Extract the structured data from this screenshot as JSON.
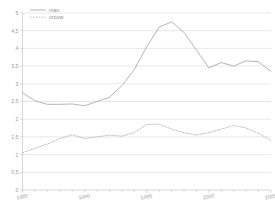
{
  "chart_data": {
    "type": "line",
    "title": "",
    "subtitle": "",
    "xlabel": "",
    "ylabel": "",
    "xlim": [
      1985,
      2005
    ],
    "ylim": [
      0,
      5
    ],
    "grid": true,
    "grid_axis": "y",
    "legend_position": "top-left",
    "x": [
      1985,
      1986,
      1987,
      1988,
      1989,
      1990,
      1991,
      1992,
      1993,
      1994,
      1995,
      1996,
      1997,
      1998,
      1999,
      2000,
      2001,
      2002,
      2003,
      2004,
      2005
    ],
    "x_tick_labels": [
      "1985",
      "1990",
      "1995",
      "2000",
      "2005"
    ],
    "x_tick_values": [
      1985,
      1990,
      1995,
      2000,
      2005
    ],
    "y_tick_labels": [
      "0",
      "0,5",
      "1",
      "1,5",
      "2",
      "2,5",
      "3",
      "3,5",
      "4",
      "4,5",
      "5"
    ],
    "y_tick_values": [
      0,
      0.5,
      1,
      1.5,
      2,
      2.5,
      3,
      3.5,
      4,
      4.5,
      5
    ],
    "series": [
      {
        "name": "man",
        "style": "solid",
        "color": "#a8a8a8",
        "values": [
          2.75,
          2.52,
          2.42,
          2.42,
          2.43,
          2.38,
          2.5,
          2.62,
          2.95,
          3.4,
          4.05,
          4.6,
          4.75,
          4.45,
          3.95,
          3.45,
          3.6,
          3.5,
          3.65,
          3.62,
          3.35
        ]
      },
      {
        "name": "vrouw",
        "style": "dotted",
        "color": "#b5b5b5",
        "values": [
          1.05,
          1.18,
          1.3,
          1.45,
          1.56,
          1.46,
          1.5,
          1.55,
          1.52,
          1.62,
          1.85,
          1.86,
          1.72,
          1.62,
          1.55,
          1.62,
          1.72,
          1.82,
          1.75,
          1.6,
          1.4
        ]
      }
    ]
  },
  "legend": {
    "entries": [
      {
        "label": "man",
        "style": "solid"
      },
      {
        "label": "vrouw",
        "style": "dotted"
      }
    ]
  },
  "colors": {
    "series_man": "#a8a8a8",
    "series_vrouw": "#b5b5b5",
    "gridline": "#d8d8d8",
    "axis": "#c4c4c4",
    "tick_text": "#9a9a9a",
    "background": "#ffffff"
  }
}
